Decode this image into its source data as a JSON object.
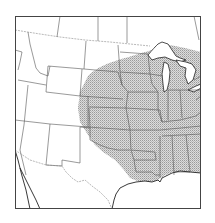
{
  "map": {
    "type": "range-map",
    "region": "United States (central and western portion)",
    "frame": {
      "x": 15,
      "y": 16,
      "width": 186,
      "height": 193,
      "stroke": "#444444"
    },
    "colors": {
      "background": "#ffffff",
      "range_fill": "#d4d4d4",
      "stipple": "#9a9a9a",
      "state_lines": "#555555",
      "coastline": "#222222",
      "international_border": "#888888"
    },
    "range_label": "shaded distribution area",
    "range_states": [
      "South Dakota",
      "Nebraska",
      "Kansas",
      "Oklahoma",
      "Texas (east)",
      "Minnesota",
      "Iowa",
      "Missouri",
      "Arkansas",
      "Louisiana",
      "Wisconsin",
      "Illinois",
      "Michigan",
      "Indiana",
      "Ohio",
      "Kentucky",
      "Tennessee",
      "Mississippi",
      "Alabama",
      "Georgia"
    ]
  }
}
